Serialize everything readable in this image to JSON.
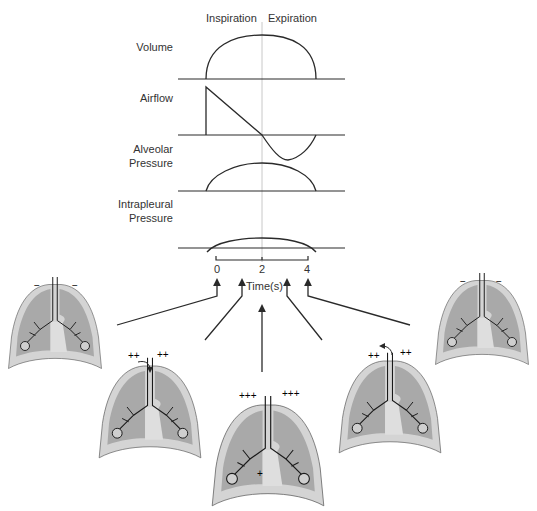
{
  "figure": {
    "phase_labels": {
      "inspiration": "Inspiration",
      "expiration": "Expiration"
    },
    "traces": [
      {
        "id": "volume",
        "label_line1": "Volume",
        "label_line2": ""
      },
      {
        "id": "airflow",
        "label_line1": "Airflow",
        "label_line2": ""
      },
      {
        "id": "alveolar",
        "label_line1": "Alveolar",
        "label_line2": "Pressure"
      },
      {
        "id": "intrapleural",
        "label_line1": "Intrapleural",
        "label_line2": "Pressure"
      }
    ],
    "time_axis": {
      "label": "Time(s)",
      "ticks": [
        "0",
        "2",
        "4"
      ]
    },
    "lung_stages": [
      {
        "position": "far-left",
        "charges_left": "−",
        "charges_right": "−",
        "airflow_arrow": "none"
      },
      {
        "position": "left",
        "charges_left": "++",
        "charges_right": "++",
        "airflow_arrow": "in"
      },
      {
        "position": "center",
        "charges_left": "+++",
        "charges_right": "+++",
        "bottom_charge": "+",
        "airflow_arrow": "none"
      },
      {
        "position": "right",
        "charges_left": "++",
        "charges_right": "++",
        "airflow_arrow": "out"
      },
      {
        "position": "far-right",
        "charges_left": "−",
        "charges_right": "−",
        "airflow_arrow": "none"
      }
    ],
    "colors": {
      "line": "#2a2a2a",
      "lung_fill": "#a9a9a9",
      "pleura_fill": "#d4d4d4",
      "mediastinum": "#dedede",
      "grid": "#c8c8c8"
    }
  }
}
